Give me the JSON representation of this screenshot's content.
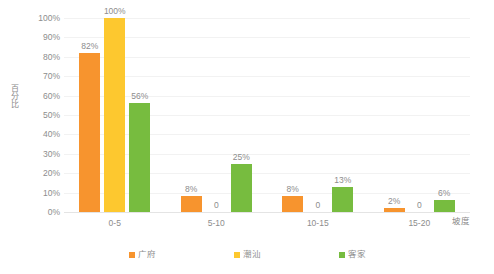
{
  "chart_data": {
    "type": "bar",
    "title": "",
    "subtitle": "",
    "xlabel": "坡度",
    "ylabel": "百分比",
    "categories": [
      "0-5",
      "5-10",
      "10-15",
      "15-20"
    ],
    "series": [
      {
        "name": "广府",
        "color": "#F7942E",
        "values": [
          82,
          8,
          8,
          2
        ],
        "labels": [
          "82%",
          "8%",
          "8%",
          "2%"
        ]
      },
      {
        "name": "潮汕",
        "color": "#FDC82F",
        "values": [
          100,
          0,
          0,
          0
        ],
        "labels": [
          "100%",
          "0",
          "0",
          "0"
        ]
      },
      {
        "name": "客家",
        "color": "#77BC3F",
        "values": [
          56,
          25,
          13,
          6
        ],
        "labels": [
          "56%",
          "25%",
          "13%",
          "6%"
        ]
      }
    ],
    "ylim": [
      0,
      100
    ],
    "y_ticks": [
      "100%",
      "90%",
      "80%",
      "70%",
      "60%",
      "50%",
      "40%",
      "30%",
      "20%",
      "10%",
      "0%"
    ],
    "y_tick_values": [
      100,
      90,
      80,
      70,
      60,
      50,
      40,
      30,
      20,
      10,
      0
    ],
    "grid": true,
    "grid_axis": "y",
    "legend_position": "bottom",
    "value_labels": true,
    "background": "#FFFFFF",
    "grid_color": "#F2F2F2",
    "text_color": "#8D8D8D"
  },
  "legend": {
    "items": [
      {
        "label": "广府",
        "color": "#F7942E"
      },
      {
        "label": "潮汕",
        "color": "#FDC82F"
      },
      {
        "label": "客家",
        "color": "#77BC3F"
      }
    ]
  }
}
